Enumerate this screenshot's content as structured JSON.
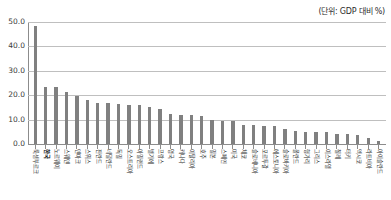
{
  "chart_data": {
    "type": "bar",
    "title": "",
    "subtitle": "",
    "unit_note": "(단위: GDP 대비 %)",
    "xlabel": "",
    "ylabel": "",
    "ylim": [
      0,
      50
    ],
    "ytick_labels": [
      "0.0",
      "10.0",
      "20.0",
      "30.0",
      "40.0",
      "50.0"
    ],
    "ytick_values": [
      0,
      10,
      20,
      30,
      40,
      50
    ],
    "grid": true,
    "legend": false,
    "bar_color": "#808080",
    "highlight_index": 1,
    "highlight_label": "한국",
    "categories": [
      "룩셈부르크",
      "한국",
      "노르웨이",
      "스웨덴",
      "덴마크",
      "스위스",
      "핀란드",
      "네덜란드",
      "독일",
      "오스트리아",
      "아일랜드",
      "벨기에",
      "프랑스",
      "영국",
      "캐나다",
      "이탈리아",
      "호주",
      "일본",
      "스페인",
      "미국",
      "체코",
      "슬로베니아",
      "포르투갈",
      "에스토니아",
      "슬로바키아",
      "폴란드",
      "헝가리",
      "그리스",
      "이스라엘",
      "칠레",
      "터키",
      "멕시코",
      "라트비아",
      "아이슬란드"
    ],
    "values": [
      48.5,
      23.5,
      23.2,
      21.5,
      19.8,
      18.0,
      17.0,
      16.8,
      16.3,
      16.1,
      15.9,
      15.0,
      14.2,
      12.5,
      12.0,
      11.9,
      11.6,
      9.8,
      9.5,
      9.4,
      7.8,
      7.6,
      7.5,
      7.4,
      6.0,
      5.2,
      5.1,
      5.1,
      5.0,
      4.1,
      4.0,
      3.8,
      2.4,
      1.4
    ]
  }
}
